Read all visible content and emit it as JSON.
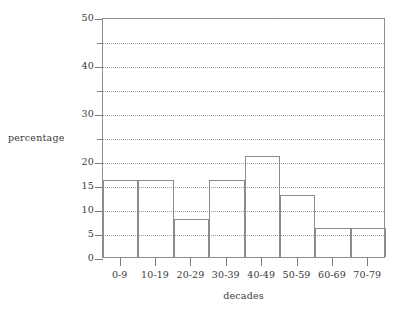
{
  "chart_data": {
    "type": "bar",
    "title": "",
    "subtitle": "",
    "xlabel": "decades",
    "ylabel": "percentage",
    "categories": [
      "0-9",
      "10-19",
      "20-29",
      "30-39",
      "40-49",
      "50-59",
      "60-69",
      "70-79"
    ],
    "values": [
      16,
      16,
      8,
      16,
      21,
      13,
      6,
      6
    ],
    "ylim": [
      0,
      50
    ],
    "xlim_categories": 8,
    "y_ticks_labeled": [
      0,
      5,
      10,
      15,
      20,
      30,
      40,
      50
    ],
    "y_ticks_unlabeled": [
      25,
      35,
      45
    ],
    "y_tick_labels": [
      "0",
      "5",
      "10",
      "15",
      "20",
      "30",
      "40",
      "50"
    ],
    "gridlines": [
      5,
      10,
      15,
      20,
      25,
      30,
      35,
      40,
      45
    ],
    "grid": "horizontal-dotted",
    "grid_on": true,
    "legend": "none",
    "legend_position": "none",
    "bar_fill": "none",
    "annotations": [],
    "colors": {
      "background": "#ffffff",
      "axis_line": "#8e8e8e",
      "gridline": "#9a9a9a",
      "bar_outline": "#8b8b8b",
      "text": "#333333"
    }
  },
  "axis_titles": {
    "x": "decades",
    "y": "percentage"
  }
}
